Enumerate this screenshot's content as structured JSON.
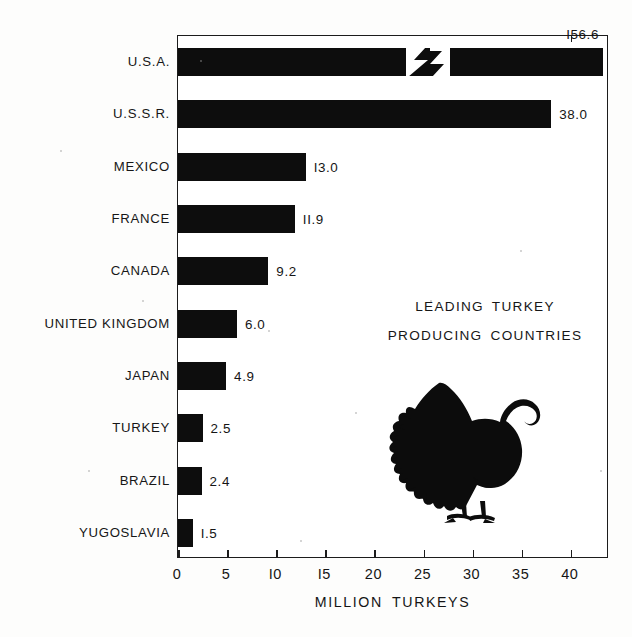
{
  "chart_data": {
    "type": "bar",
    "orientation": "horizontal",
    "title": "LEADING TURKEY PRODUCING COUNTRIES",
    "title_lines": [
      "LEADING  TURKEY",
      "PRODUCING  COUNTRIES"
    ],
    "xlabel": "MILLION TURKEYS",
    "ylabel": "",
    "xlim": [
      0,
      44
    ],
    "xticks": [
      0,
      5,
      10,
      15,
      20,
      25,
      30,
      35,
      40
    ],
    "xtick_labels": [
      "0",
      "5",
      "I0",
      "I5",
      "20",
      "25",
      "30",
      "35",
      "40"
    ],
    "grid": false,
    "legend": false,
    "axis_break": {
      "present": true,
      "series_index": 0,
      "note": "U.S.A. bar is broken (zigzag) because its value exceeds the axis range"
    },
    "categories": [
      "U.S.A.",
      "U.S.S.R.",
      "MEXICO",
      "FRANCE",
      "CANADA",
      "UNITED KINGDOM",
      "JAPAN",
      "TURKEY",
      "BRAZIL",
      "YUGOSLAVIA"
    ],
    "values": [
      156.6,
      38.0,
      13.0,
      11.9,
      9.2,
      6.0,
      4.9,
      2.5,
      2.4,
      1.5
    ],
    "value_labels": [
      "I56.6",
      "38.0",
      "I3.0",
      "II.9",
      "9.2",
      "6.0",
      "4.9",
      "2.5",
      "2.4",
      "I.5"
    ],
    "bar_color": "#0d0d0d",
    "background_color": "#ffffff",
    "illustration": "turkey-silhouette"
  },
  "axis": {
    "title": "MILLION TURKEYS"
  },
  "icons": {
    "turkey": "turkey-silhouette-icon"
  }
}
